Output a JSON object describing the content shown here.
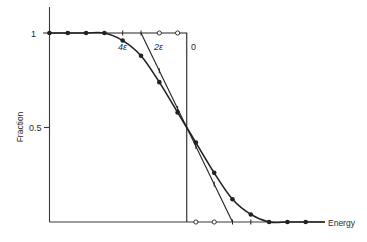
{
  "chart_data": {
    "type": "line",
    "title": "",
    "xlabel": "Energy",
    "ylabel": "Fraction",
    "yticks": [
      {
        "value": 1,
        "label": "1"
      },
      {
        "value": 0.5,
        "label": "0.5"
      }
    ],
    "ylim": [
      0,
      1
    ],
    "xlim": [
      -7.5,
      7.5
    ],
    "grid": false,
    "step_position": 0,
    "x": [
      -7.5,
      -6.5,
      -5.5,
      -4.5,
      -3.5,
      -2.5,
      -1.5,
      -0.5,
      0.5,
      1.5,
      2.5,
      3.5,
      4.5,
      5.5,
      6.5
    ],
    "series": [
      {
        "name": "4ε",
        "marker": "filled-dot",
        "style": "smooth",
        "values": [
          1,
          1,
          1,
          1,
          0.96,
          0.88,
          0.74,
          0.58,
          0.42,
          0.26,
          0.12,
          0.04,
          0,
          0,
          0
        ]
      },
      {
        "name": "2ε",
        "marker": "tick",
        "style": "linear",
        "values": [
          null,
          null,
          null,
          null,
          1,
          1,
          0.8,
          0.6,
          0.4,
          0.2,
          0,
          0,
          null,
          null,
          null
        ]
      },
      {
        "name": "0",
        "marker": "open-circle",
        "style": "step",
        "values": [
          null,
          null,
          null,
          null,
          null,
          null,
          1,
          1,
          0,
          0,
          null,
          null,
          null,
          null,
          null
        ]
      }
    ],
    "annotations": [
      {
        "text": "4ε",
        "near_series": "4ε"
      },
      {
        "text": "2ε",
        "near_series": "2ε"
      },
      {
        "text": "0",
        "near_series": "0"
      }
    ]
  },
  "labels": {
    "y_axis": "Fraction",
    "x_axis": "Energy",
    "ytick_1": "1",
    "ytick_05": "0.5",
    "curve_4e": "4ε",
    "curve_2e": "2ε",
    "curve_0": "0"
  }
}
